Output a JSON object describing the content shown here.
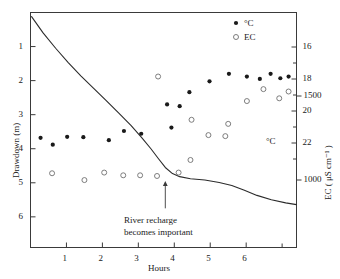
{
  "chart_data": {
    "type": "scatter",
    "title": "",
    "xlabel": "Hours",
    "ylabel": "Drawdown (m)",
    "y2label_ec": "EC ( μS cm⁻¹ )",
    "y2label_temp": "°C",
    "xlim": [
      0,
      7.4
    ],
    "ylim_drawdown": [
      0,
      6.9
    ],
    "grid": false,
    "x_ticks": [
      1,
      2,
      3,
      4,
      5,
      6
    ],
    "x_tick_labels": [
      "1",
      "2",
      "3",
      "4",
      "5",
      "6"
    ],
    "x_minor_ticks": [
      7
    ],
    "y_ticks_drawdown": [
      1,
      2,
      3,
      4,
      5,
      6
    ],
    "y_tick_labels_drawdown": [
      "1",
      "2",
      "3",
      "4",
      "5",
      "6"
    ],
    "y2_ticks_temp": [
      16,
      18,
      20,
      22
    ],
    "y2_tick_labels_temp": [
      "16",
      "18",
      "20",
      "22"
    ],
    "y2_ticks_ec": [
      1500,
      1000
    ],
    "y2_tick_labels_ec": [
      "1500",
      "1000"
    ],
    "legend": {
      "position": "top-right-inside",
      "entries": [
        {
          "label": "°C",
          "marker": "filled-circle"
        },
        {
          "label": "EC",
          "marker": "open-circle"
        }
      ]
    },
    "annotations": [
      {
        "text_line1": "River recharge",
        "text_line2": "becomes important",
        "arrow": "up",
        "arrow_x_hours": 3.75,
        "arrow_tip_y_drawdown": 4.95,
        "arrow_tail_y_drawdown": 5.75
      }
    ],
    "series": [
      {
        "name": "Drawdown",
        "type": "line",
        "marker": "none",
        "color": "#2b2b2b",
        "points": [
          {
            "x": 0.03,
            "y": 0.12
          },
          {
            "x": 0.35,
            "y": 0.6
          },
          {
            "x": 0.7,
            "y": 1.05
          },
          {
            "x": 1.05,
            "y": 1.47
          },
          {
            "x": 1.4,
            "y": 1.86
          },
          {
            "x": 1.75,
            "y": 2.22
          },
          {
            "x": 2.1,
            "y": 2.58
          },
          {
            "x": 2.45,
            "y": 2.95
          },
          {
            "x": 2.8,
            "y": 3.32
          },
          {
            "x": 3.1,
            "y": 3.68
          },
          {
            "x": 3.35,
            "y": 4.0
          },
          {
            "x": 3.55,
            "y": 4.28
          },
          {
            "x": 3.75,
            "y": 4.55
          },
          {
            "x": 3.95,
            "y": 4.73
          },
          {
            "x": 4.15,
            "y": 4.82
          },
          {
            "x": 4.45,
            "y": 4.88
          },
          {
            "x": 4.85,
            "y": 4.92
          },
          {
            "x": 5.25,
            "y": 4.99
          },
          {
            "x": 5.6,
            "y": 5.08
          },
          {
            "x": 5.95,
            "y": 5.22
          },
          {
            "x": 6.3,
            "y": 5.37
          },
          {
            "x": 6.7,
            "y": 5.5
          },
          {
            "x": 7.1,
            "y": 5.59
          },
          {
            "x": 7.4,
            "y": 5.64
          }
        ]
      },
      {
        "name": "°C",
        "type": "scatter",
        "marker": "filled-circle",
        "color": "#1a1a1a",
        "points": [
          {
            "x": 0.28,
            "y_plot": 3.68,
            "temp_c": 21.3
          },
          {
            "x": 0.62,
            "y_plot": 3.88,
            "temp_c": 21.6
          },
          {
            "x": 1.02,
            "y_plot": 3.65,
            "temp_c": 21.3
          },
          {
            "x": 1.47,
            "y_plot": 3.66,
            "temp_c": 21.3
          },
          {
            "x": 2.18,
            "y_plot": 3.75,
            "temp_c": 21.4
          },
          {
            "x": 2.6,
            "y_plot": 3.48,
            "temp_c": 21.0
          },
          {
            "x": 3.08,
            "y_plot": 3.56,
            "temp_c": 21.1
          },
          {
            "x": 3.8,
            "y_plot": 2.7,
            "temp_c": 19.9
          },
          {
            "x": 3.92,
            "y_plot": 3.38,
            "temp_c": 20.8
          },
          {
            "x": 4.15,
            "y_plot": 2.75,
            "temp_c": 20.0
          },
          {
            "x": 4.42,
            "y_plot": 2.34,
            "temp_c": 19.4
          },
          {
            "x": 4.98,
            "y_plot": 2.02,
            "temp_c": 19.0
          },
          {
            "x": 5.52,
            "y_plot": 1.8,
            "temp_c": 18.7
          },
          {
            "x": 6.02,
            "y_plot": 1.88,
            "temp_c": 18.8
          },
          {
            "x": 6.38,
            "y_plot": 1.95,
            "temp_c": 18.9
          },
          {
            "x": 6.68,
            "y_plot": 1.8,
            "temp_c": 18.7
          },
          {
            "x": 6.95,
            "y_plot": 1.93,
            "temp_c": 18.9
          },
          {
            "x": 7.18,
            "y_plot": 1.88,
            "temp_c": 18.8
          }
        ]
      },
      {
        "name": "EC",
        "type": "scatter",
        "marker": "open-circle",
        "color": "#6f6f6f",
        "points": [
          {
            "x": 0.6,
            "y_plot": 4.72,
            "ec": 1080
          },
          {
            "x": 1.5,
            "y_plot": 4.92,
            "ec": 1035
          },
          {
            "x": 2.05,
            "y_plot": 4.7,
            "ec": 1085
          },
          {
            "x": 2.58,
            "y_plot": 4.78,
            "ec": 1065
          },
          {
            "x": 3.05,
            "y_plot": 4.78,
            "ec": 1065
          },
          {
            "x": 3.52,
            "y_plot": 4.8,
            "ec": 1060
          },
          {
            "x": 3.55,
            "y_plot": 1.88,
            "ec": 1560
          },
          {
            "x": 4.12,
            "y_plot": 4.7,
            "ec": 1085
          },
          {
            "x": 4.45,
            "y_plot": 4.33,
            "ec": 1150
          },
          {
            "x": 4.48,
            "y_plot": 3.15,
            "ec": 1360
          },
          {
            "x": 4.95,
            "y_plot": 3.6,
            "ec": 1280
          },
          {
            "x": 5.42,
            "y_plot": 3.63,
            "ec": 1275
          },
          {
            "x": 5.5,
            "y_plot": 3.27,
            "ec": 1340
          },
          {
            "x": 6.02,
            "y_plot": 2.6,
            "ec": 1455
          },
          {
            "x": 6.48,
            "y_plot": 2.25,
            "ec": 1515
          },
          {
            "x": 6.92,
            "y_plot": 2.52,
            "ec": 1470
          },
          {
            "x": 7.18,
            "y_plot": 2.32,
            "ec": 1505
          }
        ]
      }
    ]
  }
}
